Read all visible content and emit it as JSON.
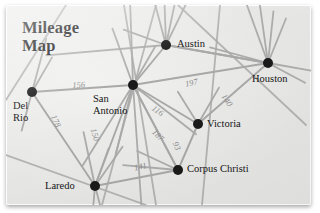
{
  "title": {
    "line1": "Mileage",
    "line2": "Map"
  },
  "theme": {
    "paper": "#ecebe9",
    "edge": "#a9a9a9",
    "node": "#1a1a1a",
    "label_text": "#151515",
    "distance_text": "#8d8d8d"
  },
  "graph": {
    "nodes": [
      {
        "id": "del-rio",
        "label": "Del\nRio",
        "x": 32,
        "y": 92,
        "label_x": 13,
        "label_y": 100
      },
      {
        "id": "san-antonio",
        "label": "San\nAntonio",
        "x": 133,
        "y": 85,
        "label_x": 93,
        "label_y": 93
      },
      {
        "id": "austin",
        "label": "Austin",
        "x": 166,
        "y": 45,
        "label_x": 177,
        "label_y": 38
      },
      {
        "id": "houston",
        "label": "Houston",
        "x": 268,
        "y": 63,
        "label_x": 252,
        "label_y": 73
      },
      {
        "id": "victoria",
        "label": "Victoria",
        "x": 198,
        "y": 124,
        "label_x": 207,
        "label_y": 118
      },
      {
        "id": "corpus-christi",
        "label": "Corpus Christi",
        "x": 178,
        "y": 170,
        "label_x": 187,
        "label_y": 163
      },
      {
        "id": "laredo",
        "label": "Laredo",
        "x": 95,
        "y": 186,
        "label_x": 45,
        "label_y": 180
      }
    ],
    "edges": [
      {
        "from": "del-rio",
        "to": "san-antonio",
        "distance": "156",
        "label_x": 72,
        "label_y": 80,
        "rotate": -3
      },
      {
        "from": "austin",
        "to": "houston",
        "distance": "197",
        "label_x": 184,
        "label_y": 79,
        "rotate": -12
      },
      {
        "from": "houston",
        "to": "victoria",
        "distance": "140",
        "label_x": 228,
        "label_y": 92,
        "rotate": 57
      },
      {
        "from": "del-rio",
        "to": "laredo",
        "distance": "178",
        "label_x": 58,
        "label_y": 113,
        "rotate": 65
      },
      {
        "from": "san-antonio",
        "to": "laredo",
        "distance": "150",
        "label_x": 98,
        "label_y": 127,
        "rotate": 72
      },
      {
        "from": "san-antonio",
        "to": "victoria",
        "distance": "116",
        "label_x": 156,
        "label_y": 103,
        "rotate": 36
      },
      {
        "from": "san-antonio",
        "to": "corpus-christi",
        "distance": "187",
        "label_x": 157,
        "label_y": 127,
        "rotate": 44
      },
      {
        "from": "victoria",
        "to": "corpus-christi",
        "distance": "93",
        "label_x": 180,
        "label_y": 140,
        "rotate": 68
      },
      {
        "from": "laredo",
        "to": "corpus-christi",
        "distance": "141",
        "label_x": 133,
        "label_y": 163,
        "rotate": -13
      }
    ],
    "unlabeled_edges": [
      {
        "from": "san-antonio",
        "to": "austin"
      },
      {
        "from": "austin",
        "to": "houston"
      },
      {
        "from": "san-antonio",
        "to": "houston"
      }
    ]
  }
}
